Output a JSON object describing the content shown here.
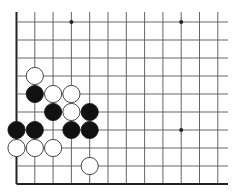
{
  "board": {
    "title": "Go board diagram (lower-left corner region)",
    "origin_x": 16.5,
    "origin_y": 22,
    "spacing_x": 18.3,
    "spacing_y": 18,
    "cols": 12,
    "rows": 10,
    "line_extend_right": 228,
    "line_extend_top": 12,
    "edges": [
      "left",
      "bottom"
    ],
    "colors": {
      "line": "#555555",
      "edge": "#222222",
      "black_stone": "#111111",
      "white_stone": "#ffffff",
      "white_stroke": "#333333",
      "star": "#222222"
    },
    "star_points": [
      {
        "col": 3,
        "row": 0
      },
      {
        "col": 9,
        "row": 0
      },
      {
        "col": 9,
        "row": 6
      }
    ],
    "stones": [
      {
        "color": "white",
        "col": 1,
        "row": 3
      },
      {
        "color": "black",
        "col": 1,
        "row": 4
      },
      {
        "color": "white",
        "col": 2,
        "row": 4
      },
      {
        "color": "white",
        "col": 3,
        "row": 4
      },
      {
        "color": "black",
        "col": 2,
        "row": 5
      },
      {
        "color": "white",
        "col": 3,
        "row": 5
      },
      {
        "color": "black",
        "col": 4,
        "row": 5
      },
      {
        "color": "black",
        "col": 0,
        "row": 6
      },
      {
        "color": "black",
        "col": 1,
        "row": 6
      },
      {
        "color": "black",
        "col": 3,
        "row": 6
      },
      {
        "color": "black",
        "col": 4,
        "row": 6
      },
      {
        "color": "white",
        "col": 0,
        "row": 7
      },
      {
        "color": "white",
        "col": 1,
        "row": 7
      },
      {
        "color": "white",
        "col": 2,
        "row": 7
      },
      {
        "color": "white",
        "col": 4,
        "row": 8
      }
    ]
  }
}
